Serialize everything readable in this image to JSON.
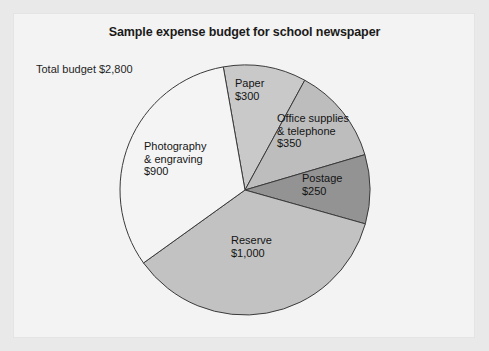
{
  "chart_data": {
    "type": "pie",
    "title": "Sample expense budget for school newspaper",
    "total_label": "Total budget $2,800",
    "total_value": 2800,
    "currency": "$",
    "xlabel": "",
    "ylabel": "",
    "legend": "none",
    "grid": false,
    "start_angle_deg": -10,
    "center": {
      "x": 245,
      "y": 190
    },
    "radius": 125,
    "categories": [
      "Paper",
      "Office supplies & telephone",
      "Postage",
      "Reserve",
      "Photography & engraving"
    ],
    "values": [
      300,
      350,
      250,
      1000,
      900
    ],
    "slices": [
      {
        "name": "Paper",
        "value": 300,
        "value_label": "$300",
        "label_lines": [
          "Paper",
          "$300"
        ],
        "color": "#c9c9c9",
        "percent": 10.7
      },
      {
        "name": "Office supplies & telephone",
        "value": 350,
        "value_label": "$350",
        "label_lines": [
          "Office supplies",
          "& telephone",
          "$350"
        ],
        "color": "#bdbdbd",
        "percent": 12.5
      },
      {
        "name": "Postage",
        "value": 250,
        "value_label": "$250",
        "label_lines": [
          "Postage",
          "$250"
        ],
        "color": "#939393",
        "percent": 8.9
      },
      {
        "name": "Reserve",
        "value": 1000,
        "value_label": "$1,000",
        "label_lines": [
          "Reserve",
          "$1,000"
        ],
        "color": "#c2c2c2",
        "percent": 35.7
      },
      {
        "name": "Photography & engraving",
        "value": 900,
        "value_label": "$900",
        "label_lines": [
          "Photography",
          "& engraving",
          "$900"
        ],
        "color": "#f4f4f4",
        "percent": 32.1
      }
    ],
    "stroke_color": "#3a3a3a",
    "stroke_width": 1
  },
  "labels": {
    "paper": "Paper\n$300",
    "office": "Office supplies\n& telephone\n$350",
    "postage": "Postage\n$250",
    "reserve": "Reserve\n$1,000",
    "photography": "Photography\n& engraving\n$900"
  }
}
